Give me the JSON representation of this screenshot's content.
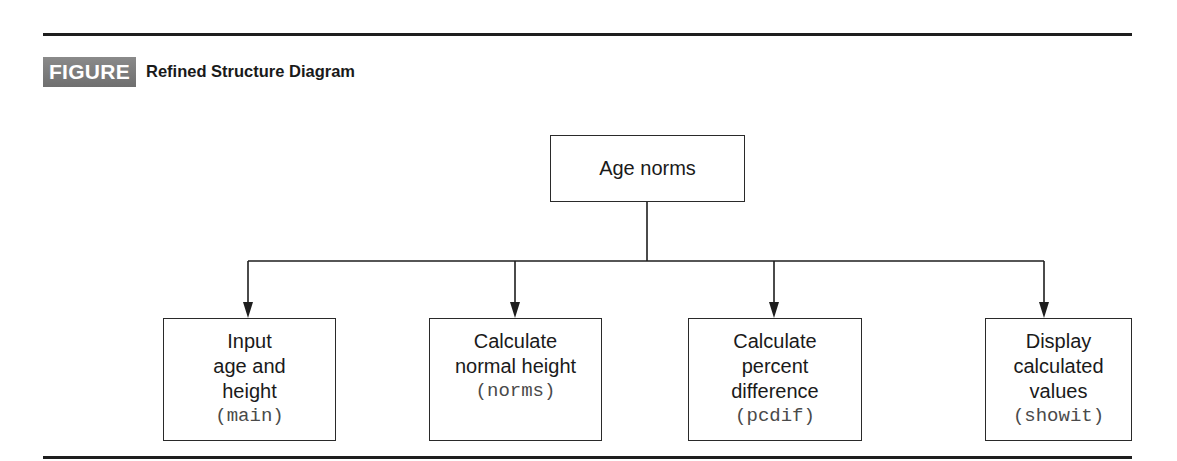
{
  "figure": {
    "number_label": "FIGURE 7.19",
    "title": "Refined Structure Diagram"
  },
  "diagram": {
    "type": "structure-chart",
    "root": {
      "label": "Age norms"
    },
    "children": [
      {
        "label_lines": [
          "Input",
          "age and",
          "height"
        ],
        "function_name": "(main)"
      },
      {
        "label_lines": [
          "Calculate",
          "normal height"
        ],
        "function_name": "(norms)"
      },
      {
        "label_lines": [
          "Calculate",
          "percent",
          "difference"
        ],
        "function_name": "(pcdif)"
      },
      {
        "label_lines": [
          "Display",
          "calculated",
          "values"
        ],
        "function_name": "(showit)"
      }
    ],
    "edges": [
      {
        "from": "Age norms",
        "to": "Input age and height"
      },
      {
        "from": "Age norms",
        "to": "Calculate normal height"
      },
      {
        "from": "Age norms",
        "to": "Calculate percent difference"
      },
      {
        "from": "Age norms",
        "to": "Display calculated values"
      }
    ]
  },
  "colors": {
    "badge_bg": "#7a7a7a",
    "badge_text": "#ffffff",
    "line": "#1e1e1e",
    "code_text": "#4a4a4a"
  }
}
